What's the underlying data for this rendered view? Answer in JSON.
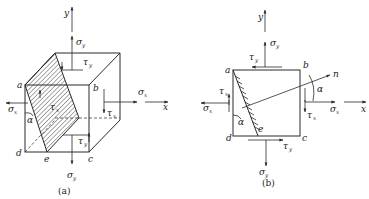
{
  "figure_a": {
    "caption": "(a)",
    "axis_y": "y",
    "axis_x": "x",
    "vertices": {
      "a": "a",
      "b": "b",
      "c": "c",
      "d": "d",
      "e": "e"
    },
    "angle": "α",
    "stress_labels": {
      "sigma": "σ",
      "tau": "τ",
      "sub_x": "x",
      "sub_y": "y"
    }
  },
  "figure_b": {
    "caption": "(b)",
    "axis_y": "y",
    "axis_x": "x",
    "normal": "n",
    "vertices": {
      "a": "a",
      "b": "b",
      "c": "c",
      "d": "d",
      "e": "e"
    },
    "angle": "α",
    "stress_labels": {
      "sigma": "σ",
      "tau": "τ",
      "sub_x": "x",
      "sub_y": "y"
    }
  },
  "colors": {
    "stroke": "#2a2a2a",
    "background": "#ffffff"
  }
}
